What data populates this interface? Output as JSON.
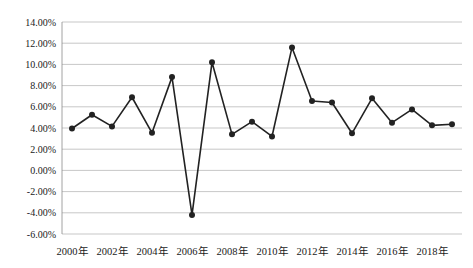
{
  "chart_data": {
    "type": "line",
    "title": "",
    "xlabel": "",
    "ylabel": "",
    "grid": true,
    "legend": null,
    "ylim": [
      -0.06,
      0.14
    ],
    "ytick_labels": [
      "14.00%",
      "12.00%",
      "10.00%",
      "8.00%",
      "6.00%",
      "4.00%",
      "2.00%",
      "0.00%",
      "-2.00%",
      "-4.00%",
      "-6.00%"
    ],
    "ytick_values": [
      0.14,
      0.12,
      0.1,
      0.08,
      0.06,
      0.04,
      0.02,
      0.0,
      -0.02,
      -0.04,
      -0.06
    ],
    "xtick_labels": [
      "2000年",
      "2002年",
      "2004年",
      "2006年",
      "2008年",
      "2010年",
      "2012年",
      "2014年",
      "2016年",
      "2018年"
    ],
    "categories": [
      "2000年",
      "2001年",
      "2002年",
      "2003年",
      "2004年",
      "2005年",
      "2006年",
      "2007年",
      "2008年",
      "2009年",
      "2010年",
      "2011年",
      "2012年",
      "2013年",
      "2014年",
      "2015年",
      "2016年",
      "2017年",
      "2018年",
      "2019年"
    ],
    "series": [
      {
        "name": "",
        "color": "#222222",
        "marker": "circle",
        "values": [
          0.0395,
          0.0525,
          0.0415,
          0.069,
          0.0355,
          0.088,
          -0.042,
          0.102,
          0.034,
          0.046,
          0.032,
          0.116,
          0.0655,
          0.064,
          0.035,
          0.068,
          0.045,
          0.0575,
          0.0425,
          0.0435
        ]
      }
    ]
  }
}
